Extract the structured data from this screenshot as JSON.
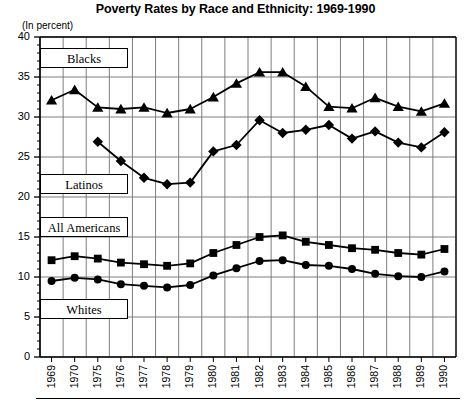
{
  "chart_data": {
    "type": "line",
    "title": "Poverty Rates by Race and Ethnicity: 1969-1990",
    "subtitle": "(In percent)",
    "xlabel": "",
    "ylabel": "(In percent)",
    "ylim": [
      0,
      40
    ],
    "yticks": [
      0,
      5,
      10,
      15,
      20,
      25,
      30,
      35,
      40
    ],
    "grid": true,
    "legend_position": "inline-boxes",
    "categories": [
      "1969",
      "1970",
      "1975",
      "1976",
      "1977",
      "1978",
      "1979",
      "1980",
      "1981",
      "1982",
      "1983",
      "1984",
      "1985",
      "1986",
      "1987",
      "1988",
      "1989",
      "1990"
    ],
    "series": [
      {
        "name": "Blacks",
        "marker": "triangle",
        "color": "#000000",
        "values": [
          32.1,
          33.4,
          31.2,
          31.0,
          31.2,
          30.5,
          31.0,
          32.5,
          34.2,
          35.6,
          35.6,
          33.8,
          31.3,
          31.1,
          32.4,
          31.3,
          30.7,
          31.7
        ]
      },
      {
        "name": "Latinos",
        "marker": "diamond",
        "color": "#000000",
        "values": [
          null,
          null,
          26.9,
          24.5,
          22.4,
          21.6,
          21.8,
          25.7,
          26.5,
          29.6,
          28.0,
          28.4,
          29.0,
          27.3,
          28.2,
          26.8,
          26.2,
          28.1
        ]
      },
      {
        "name": "All Americans",
        "marker": "square",
        "color": "#000000",
        "values": [
          12.1,
          12.6,
          12.3,
          11.8,
          11.6,
          11.4,
          11.7,
          13.0,
          14.0,
          15.0,
          15.2,
          14.4,
          14.0,
          13.6,
          13.4,
          13.0,
          12.8,
          13.5
        ]
      },
      {
        "name": "Whites",
        "marker": "circle",
        "color": "#000000",
        "values": [
          9.5,
          9.9,
          9.7,
          9.1,
          8.9,
          8.7,
          9.0,
          10.2,
          11.1,
          12.0,
          12.1,
          11.5,
          11.4,
          11.0,
          10.4,
          10.1,
          10.0,
          10.7
        ]
      }
    ],
    "series_label_boxes": [
      {
        "label": "Blacks",
        "left": 40,
        "top": 48,
        "width": 88
      },
      {
        "label": "Latinos",
        "left": 40,
        "top": 174,
        "width": 88
      },
      {
        "label": "All Americans",
        "left": 40,
        "top": 217,
        "width": 88
      },
      {
        "label": "Whites",
        "left": 40,
        "top": 299,
        "width": 88
      }
    ]
  }
}
